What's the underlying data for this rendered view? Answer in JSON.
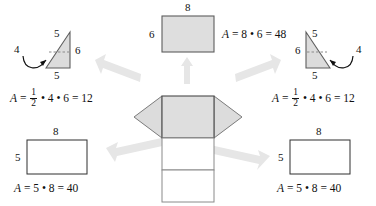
{
  "figure": {
    "colors": {
      "shaded_fill": "#dedede",
      "triangle_fill": "#dcdcdc",
      "stroke": "#6e6e6e",
      "dark_stroke": "#4a4a4a",
      "arrow_fill": "#e3e3e3",
      "text": "#111111",
      "white_fill": "#ffffff"
    }
  },
  "parts": {
    "left_triangle": {
      "name": "left-triangle-face",
      "labels": {
        "top": "5",
        "bottom": "5",
        "right": "6",
        "height": "4"
      },
      "formula": {
        "lead": "A",
        "equals": "=",
        "frac_num": "1",
        "frac_den": "2",
        "dot1": "•",
        "factor1": "4",
        "dot2": "•",
        "factor2": "6",
        "equals2": "=",
        "result": "12",
        "plain": "A = 1/2 • 4 • 6 = 12"
      }
    },
    "right_triangle": {
      "name": "right-triangle-face",
      "labels": {
        "top": "5",
        "bottom": "5",
        "left": "6",
        "height": "4"
      },
      "formula": {
        "lead": "A",
        "equals": "=",
        "frac_num": "1",
        "frac_den": "2",
        "dot1": "•",
        "factor1": "4",
        "dot2": "•",
        "factor2": "6",
        "equals2": "=",
        "result": "12",
        "plain": "A = 1/2 • 4 • 6 = 12"
      }
    },
    "top_rectangle": {
      "name": "top-rectangle-face",
      "labels": {
        "top": "8",
        "left": "6"
      },
      "formula": {
        "lead": "A",
        "equals": "=",
        "factor1": "8",
        "dot1": "•",
        "factor2": "6",
        "equals2": "=",
        "result": "48",
        "plain": "A = 8 • 6 = 48"
      }
    },
    "bottom_left_rectangle": {
      "name": "bottom-left-rectangle-face",
      "labels": {
        "top": "8",
        "left": "5"
      },
      "formula": {
        "lead": "A",
        "equals": "=",
        "factor1": "5",
        "dot1": "•",
        "factor2": "8",
        "equals2": "=",
        "result": "40",
        "plain": "A = 5 • 8 = 40"
      }
    },
    "bottom_right_rectangle": {
      "name": "bottom-right-rectangle-face",
      "labels": {
        "top": "8",
        "left": "5"
      },
      "formula": {
        "lead": "A",
        "equals": "=",
        "factor1": "5",
        "dot1": "•",
        "factor2": "8",
        "equals2": "=",
        "result": "40",
        "plain": "A = 5 • 8 = 40"
      }
    },
    "net": {
      "name": "prism-net",
      "description": "Central net: two shaded triangular flaps left and right, one shaded rectangle, two white rectangles stacked below"
    }
  },
  "arrows": [
    {
      "name": "arrow-to-left-triangle",
      "direction": "up-left"
    },
    {
      "name": "arrow-to-top-rectangle",
      "direction": "up"
    },
    {
      "name": "arrow-to-right-triangle",
      "direction": "up-right"
    },
    {
      "name": "arrow-to-bottom-left-rectangle",
      "direction": "down-left"
    },
    {
      "name": "arrow-to-bottom-right-rectangle",
      "direction": "down-right"
    }
  ]
}
